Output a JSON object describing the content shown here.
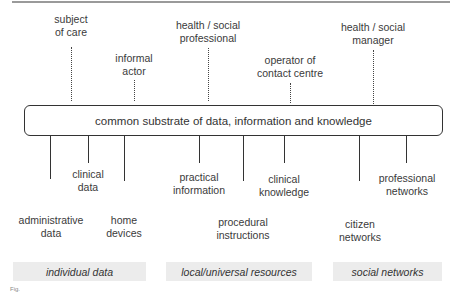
{
  "diagram": {
    "actors_above": [
      {
        "label": "subject\nof care",
        "x": 71
      },
      {
        "label": "informal\nactor",
        "x": 134
      },
      {
        "label": "health / social\nprofessional",
        "x": 208
      },
      {
        "label": "operator of\ncontact centre",
        "x": 290
      },
      {
        "label": "health / social\nmanager",
        "x": 373
      }
    ],
    "substrate_label": "common substrate of data, information and knowledge",
    "resources_below": [
      {
        "label": "administrative\ndata",
        "x": 51
      },
      {
        "label": "clinical\ndata",
        "x": 88
      },
      {
        "label": "home\ndevices",
        "x": 124
      },
      {
        "label": "practical\ninformation",
        "x": 199
      },
      {
        "label": "procedural\ninstructions",
        "x": 243
      },
      {
        "label": "clinical\nknowledge",
        "x": 284
      },
      {
        "label": "citizen\nnetworks",
        "x": 360
      },
      {
        "label": "professional\nnetworks",
        "x": 407
      }
    ],
    "categories": [
      {
        "label": "individual data"
      },
      {
        "label": "local/universal resources"
      },
      {
        "label": "social networks"
      }
    ],
    "caption_fragment": "Fig."
  }
}
